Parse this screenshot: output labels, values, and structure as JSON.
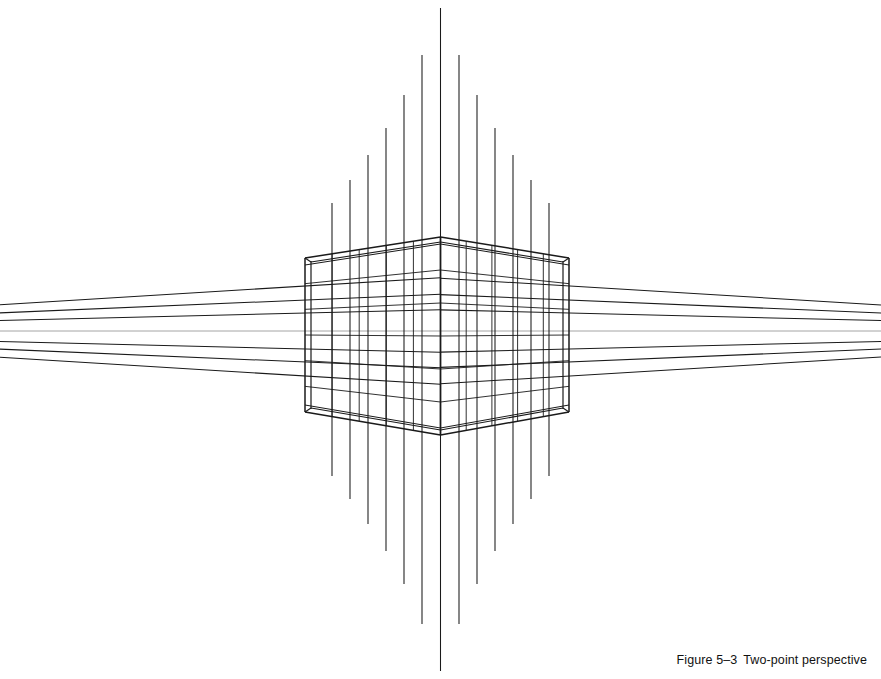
{
  "figure": {
    "caption_label": "Figure 5–3",
    "caption_title": "Two-point perspective",
    "title": "Two-point perspective",
    "background_color": "#ffffff",
    "line_color": "#1a1a1a",
    "horizon_color": "#8d8d8d"
  },
  "chart_data": {
    "type": "diagram",
    "title": "Two-point perspective",
    "subtitle": "",
    "xlabel": "",
    "ylabel": "",
    "grid": false,
    "legend": null,
    "canvas": {
      "width": 881,
      "height": 679
    },
    "vanishing_points": [
      {
        "name": "left-vanishing-point",
        "x": -430,
        "y": 331
      },
      {
        "name": "right-vanishing-point",
        "x": 1311,
        "y": 331
      }
    ],
    "horizon_line": {
      "y": 331,
      "x_start": 0,
      "x_end": 881,
      "color": "#8d8d8d"
    },
    "center_axis_x": 440.5,
    "box": {
      "left_edge_x": 305,
      "right_edge_x": 569,
      "near_corner_x": 440.5,
      "near_corner_top_y": 237,
      "near_corner_bottom_y": 435,
      "left_corner_top_y": 258,
      "left_corner_bottom_y": 412,
      "right_corner_top_y": 258,
      "right_corner_bottom_y": 412,
      "inner_offset": 6,
      "grid_rows": 6,
      "grid_cols": 5
    },
    "vertical_lines": {
      "count": 13,
      "x": [
        332,
        350,
        368,
        386,
        404,
        422,
        440.5,
        459,
        477,
        495,
        513,
        531,
        549
      ],
      "top_y": [
        203,
        180,
        155,
        128,
        95,
        55,
        8,
        55,
        95,
        128,
        155,
        180,
        203
      ],
      "bottom_y": [
        476,
        499,
        524,
        551,
        584,
        624,
        671,
        624,
        584,
        551,
        524,
        499,
        476
      ]
    },
    "converging_lines": {
      "count": 7,
      "left_edge_y": [
        286,
        300,
        313,
        331,
        349,
        362,
        376
      ],
      "right_edge_y": [
        286,
        300,
        313,
        331,
        349,
        362,
        376
      ]
    }
  }
}
